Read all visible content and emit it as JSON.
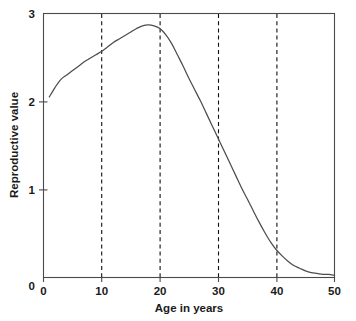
{
  "chart_data": {
    "type": "line",
    "title": "",
    "xlabel": "Age in years",
    "ylabel": "Reproductive value",
    "xlim": [
      0,
      50
    ],
    "ylim": [
      0,
      3
    ],
    "xticks": [
      0,
      10,
      20,
      30,
      40,
      50
    ],
    "xtick_labels": [
      "0",
      "10",
      "20",
      "30",
      "40",
      "50"
    ],
    "yticks": [
      0,
      1,
      2,
      3
    ],
    "ytick_labels": [
      "0",
      "1",
      "2",
      "3"
    ],
    "grid": "vertical-dashed",
    "gridlines_x": [
      10,
      20,
      30,
      40
    ],
    "legend": "none",
    "series": [
      {
        "name": "Reproductive value",
        "color": "#4d4d4d",
        "style": "solid",
        "x": [
          1,
          2,
          3,
          4,
          5,
          6,
          7,
          8,
          9,
          10,
          11,
          12,
          13,
          14,
          15,
          16,
          17,
          18,
          19,
          20,
          21,
          22,
          23,
          24,
          25,
          26,
          27,
          28,
          29,
          30,
          31,
          32,
          33,
          34,
          35,
          36,
          37,
          38,
          39,
          40,
          41,
          42,
          43,
          44,
          45,
          46,
          47,
          48,
          49,
          50
        ],
        "values": [
          2.05,
          2.16,
          2.25,
          2.3,
          2.35,
          2.4,
          2.45,
          2.49,
          2.53,
          2.57,
          2.62,
          2.67,
          2.71,
          2.75,
          2.79,
          2.83,
          2.86,
          2.87,
          2.86,
          2.83,
          2.76,
          2.66,
          2.53,
          2.4,
          2.26,
          2.13,
          2.0,
          1.86,
          1.72,
          1.58,
          1.44,
          1.3,
          1.16,
          1.02,
          0.89,
          0.76,
          0.63,
          0.51,
          0.4,
          0.31,
          0.24,
          0.18,
          0.13,
          0.1,
          0.07,
          0.05,
          0.04,
          0.03,
          0.03,
          0.02
        ]
      }
    ],
    "annotations": []
  },
  "axes": {
    "y_label_text": "Reproductive value",
    "x_label_text": "Age in years"
  },
  "colors": {
    "curve": "#4d4d4d",
    "frame": "#4a4a4a",
    "gridline": "#111111",
    "text": "#1a1a1a",
    "background": "#ffffff"
  }
}
